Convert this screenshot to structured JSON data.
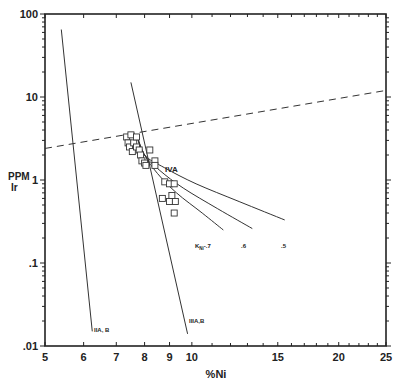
{
  "chart_data": {
    "type": "scatter",
    "title": "",
    "xlabel": "%Ni",
    "ylabel": [
      "PPM",
      "Ir"
    ],
    "xscale": "log",
    "yscale": "log",
    "xlim": [
      5,
      25
    ],
    "ylim": [
      0.01,
      100
    ],
    "x_ticks": [
      "5",
      "6",
      "7",
      "8",
      "9",
      "10",
      "15",
      "20",
      "25"
    ],
    "x_tick_values": [
      5,
      6,
      7,
      8,
      9,
      10,
      15,
      20,
      25
    ],
    "y_ticks": [
      ".01",
      ".1",
      "1",
      "10",
      "100"
    ],
    "y_tick_values": [
      0.01,
      0.1,
      1,
      10,
      100
    ],
    "grid": false,
    "series": [
      {
        "name": "IIA,B",
        "kind": "line",
        "points": [
          [
            5.4,
            65
          ],
          [
            6.25,
            0.015
          ]
        ]
      },
      {
        "name": "IIIA,B",
        "kind": "line",
        "points": [
          [
            7.5,
            15
          ],
          [
            9.8,
            0.014
          ]
        ]
      },
      {
        "name": "dashed reference",
        "kind": "dashed-line",
        "points": [
          [
            5,
            2.4
          ],
          [
            25,
            12
          ]
        ]
      },
      {
        "name": "KNi=.7",
        "kind": "curve",
        "points": [
          [
            7.7,
            3.5
          ],
          [
            8.0,
            2.0
          ],
          [
            8.5,
            1.2
          ],
          [
            9.3,
            0.7
          ],
          [
            10.5,
            0.4
          ],
          [
            11.6,
            0.25
          ]
        ]
      },
      {
        "name": ".6",
        "kind": "curve",
        "points": [
          [
            7.7,
            3.5
          ],
          [
            8.0,
            2.0
          ],
          [
            8.6,
            1.3
          ],
          [
            9.6,
            0.8
          ],
          [
            11.3,
            0.45
          ],
          [
            13.3,
            0.26
          ]
        ]
      },
      {
        "name": ".5",
        "kind": "curve",
        "points": [
          [
            7.7,
            3.5
          ],
          [
            8.0,
            2.0
          ],
          [
            8.8,
            1.4
          ],
          [
            10.2,
            0.9
          ],
          [
            12.5,
            0.55
          ],
          [
            15.5,
            0.33
          ]
        ]
      },
      {
        "name": "IVA data",
        "kind": "scatter",
        "marker": "square-open",
        "points": [
          [
            7.35,
            3.3
          ],
          [
            7.4,
            2.8
          ],
          [
            7.5,
            3.5
          ],
          [
            7.45,
            2.5
          ],
          [
            7.55,
            2.2
          ],
          [
            7.6,
            2.8
          ],
          [
            7.7,
            3.3
          ],
          [
            7.7,
            2.5
          ],
          [
            7.8,
            2.3
          ],
          [
            7.85,
            2.0
          ],
          [
            7.9,
            1.7
          ],
          [
            8.0,
            1.6
          ],
          [
            8.2,
            2.3
          ],
          [
            8.4,
            1.7
          ],
          [
            8.4,
            1.5
          ],
          [
            8.05,
            1.5
          ],
          [
            8.8,
            0.95
          ],
          [
            9.0,
            0.9
          ],
          [
            9.2,
            0.9
          ],
          [
            9.1,
            0.65
          ],
          [
            8.7,
            0.6
          ],
          [
            9.0,
            0.55
          ],
          [
            9.25,
            0.55
          ],
          [
            9.2,
            0.4
          ]
        ]
      }
    ],
    "annotations": [
      {
        "text": "IVA",
        "x": 8.8,
        "y": 1.2
      },
      {
        "text": "IIA,B",
        "x": 6.3,
        "y": 0.016
      },
      {
        "text": "IIIA,B",
        "x": 9.85,
        "y": 0.018
      },
      {
        "text": "KNi=.7",
        "x": 11.7,
        "y": 0.2
      },
      {
        "text": ".6",
        "x": 13.3,
        "y": 0.2
      },
      {
        "text": ".5",
        "x": 15.5,
        "y": 0.2
      }
    ]
  },
  "labels": {
    "x_axis": "%Ni",
    "y_axis_line1": "PPM",
    "y_axis_line2": "Ir",
    "iva": "IVA",
    "iiab": "IIA, B",
    "iiiab": "IIIA,B",
    "k_main": "K",
    "k_sub": "Ni",
    "k_val": "-.7",
    "k6": ".6",
    "k5": ".5"
  }
}
